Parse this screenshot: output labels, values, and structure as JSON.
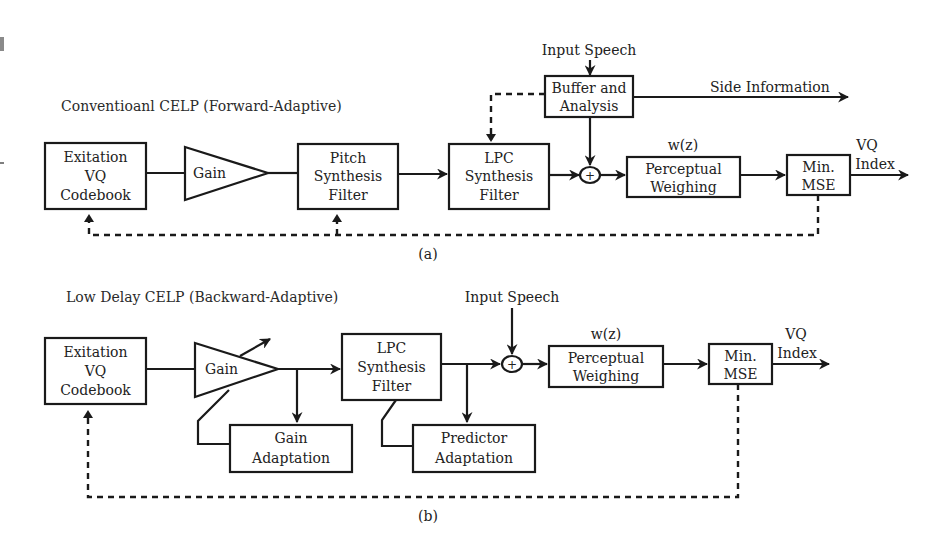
{
  "diagram_a": {
    "title": "Conventioanl CELP (Forward-Adaptive)",
    "caption": "(a)",
    "blocks": {
      "codebook": [
        "Exitation",
        "VQ",
        "Codebook"
      ],
      "gain": "Gain",
      "pitch": [
        "Pitch",
        "Synthesis",
        "Filter"
      ],
      "lpc": [
        "LPC",
        "Synthesis",
        "Filter"
      ],
      "buffer": [
        "Buffer and",
        "Analysis"
      ],
      "perceptual": [
        "Perceptual",
        "Weighing"
      ],
      "minmse": [
        "Min.",
        "MSE"
      ]
    },
    "labels": {
      "input_speech": "Input Speech",
      "side_information": "Side Information",
      "wz": "w(z)",
      "vq_index": [
        "VQ",
        "Index"
      ],
      "sum": "+"
    }
  },
  "diagram_b": {
    "title": "Low Delay CELP (Backward-Adaptive)",
    "caption": "(b)",
    "blocks": {
      "codebook": [
        "Exitation",
        "VQ",
        "Codebook"
      ],
      "gain": "Gain",
      "gain_adaptation": [
        "Gain",
        "Adaptation"
      ],
      "lpc": [
        "LPC",
        "Synthesis",
        "Filter"
      ],
      "predictor_adaptation": [
        "Predictor",
        "Adaptation"
      ],
      "perceptual": [
        "Perceptual",
        "Weighing"
      ],
      "minmse": [
        "Min.",
        "MSE"
      ]
    },
    "labels": {
      "input_speech": "Input Speech",
      "wz": "w(z)",
      "vq_index": [
        "VQ",
        "Index"
      ],
      "sum": "+"
    }
  },
  "colors": {
    "stroke": "#1a1a1a",
    "text": "#222222",
    "background": "#ffffff"
  }
}
